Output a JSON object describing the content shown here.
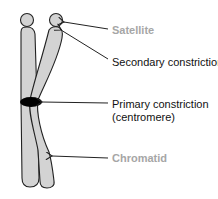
{
  "diagram": {
    "labels": [
      {
        "id": "satellite",
        "text": "Satellite",
        "color": "#a6a6a6"
      },
      {
        "id": "secondary_constriction",
        "text": "Secondary constriction",
        "color": "#111111"
      },
      {
        "id": "primary_constriction",
        "text": "Primary constriction",
        "text2": "(centromere)",
        "color": "#111111"
      },
      {
        "id": "chromatid",
        "text": "Chromatid",
        "color": "#a6a6a6"
      }
    ],
    "colors": {
      "chromatid_fill": "#d3d3d3",
      "outline": "#222222",
      "centromere": "#000000",
      "background": "#ffffff"
    }
  }
}
